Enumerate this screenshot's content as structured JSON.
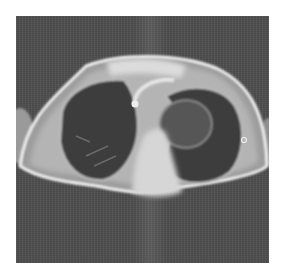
{
  "image": {
    "kind": "axial chest MRI scan",
    "colors": {
      "background": "#4e4e4e",
      "body_wall": "#c8c8c8",
      "skin_edge": "#eeeeee",
      "lung": "#3a3a3a",
      "mediastinum": "#d8d8d8",
      "page": "#ffffff"
    }
  }
}
